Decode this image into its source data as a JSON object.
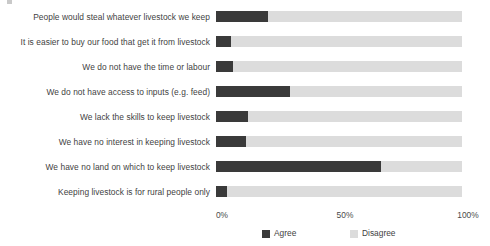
{
  "chart_data": {
    "type": "bar",
    "orientation": "horizontal",
    "stacked": true,
    "title": "",
    "subtitle": "",
    "xlabel": "",
    "ylabel": "",
    "xlim": [
      0,
      100
    ],
    "grid": false,
    "legend_position": "bottom",
    "xticks": [
      "0%",
      "50%",
      "100%"
    ],
    "xtick_values": [
      0,
      50,
      100
    ],
    "categories": [
      "People would steal whatever livestock we keep",
      "It is easier to buy our food that get it from livestock",
      "We do not have the time or labour",
      "We do not have access to inputs (e.g. feed)",
      "We lack the skills to keep livestock",
      "We have no interest in keeping livestock",
      "We have no land on which to keep livestock",
      "Keeping livestock is for rural people only"
    ],
    "series": [
      {
        "name": "Agree",
        "color": "#3a3a3a",
        "values": [
          21,
          6,
          7,
          30,
          13,
          12,
          67,
          4.5
        ]
      },
      {
        "name": "Disagree",
        "color": "#dcdcdc",
        "values": [
          79,
          94,
          93,
          70,
          87,
          88,
          33,
          95.5
        ]
      }
    ]
  },
  "legend": {
    "items": [
      {
        "label": "Agree",
        "color": "#3a3a3a"
      },
      {
        "label": "Disagree",
        "color": "#dcdcdc"
      }
    ]
  }
}
